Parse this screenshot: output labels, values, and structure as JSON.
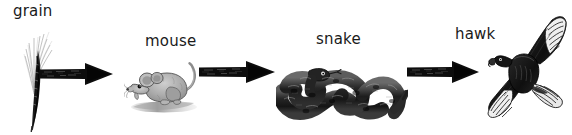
{
  "diagram": {
    "type": "food-chain",
    "background_color": "#ffffff",
    "ink_color": "#1a1a1a",
    "width": 572,
    "height": 135,
    "nodes": [
      {
        "id": "grain",
        "label": "grain",
        "icon": "grain-stalk-illustration",
        "label_x": 13,
        "label_y": 4,
        "art_x": 18,
        "art_y": 26,
        "art_w": 42,
        "art_h": 106
      },
      {
        "id": "mouse",
        "label": "mouse",
        "icon": "mouse-illustration",
        "label_x": 145,
        "label_y": 34,
        "art_x": 124,
        "art_y": 57,
        "art_w": 82,
        "art_h": 58
      },
      {
        "id": "snake",
        "label": "snake",
        "icon": "snake-illustration",
        "label_x": 316,
        "label_y": 32,
        "art_x": 276,
        "art_y": 55,
        "art_w": 132,
        "art_h": 66
      },
      {
        "id": "hawk",
        "label": "hawk",
        "icon": "hawk-illustration",
        "label_x": 455,
        "label_y": 27,
        "art_x": 482,
        "art_y": 12,
        "art_w": 88,
        "art_h": 118
      }
    ],
    "arrows": [
      {
        "id": "grain-to-mouse",
        "from": "grain",
        "to": "mouse",
        "x": 38,
        "y": 60,
        "w": 76,
        "h": 28
      },
      {
        "id": "mouse-to-snake",
        "from": "mouse",
        "to": "snake",
        "x": 198,
        "y": 58,
        "w": 78,
        "h": 28
      },
      {
        "id": "snake-to-hawk",
        "from": "snake",
        "to": "hawk",
        "x": 406,
        "y": 58,
        "w": 74,
        "h": 28
      }
    ]
  }
}
